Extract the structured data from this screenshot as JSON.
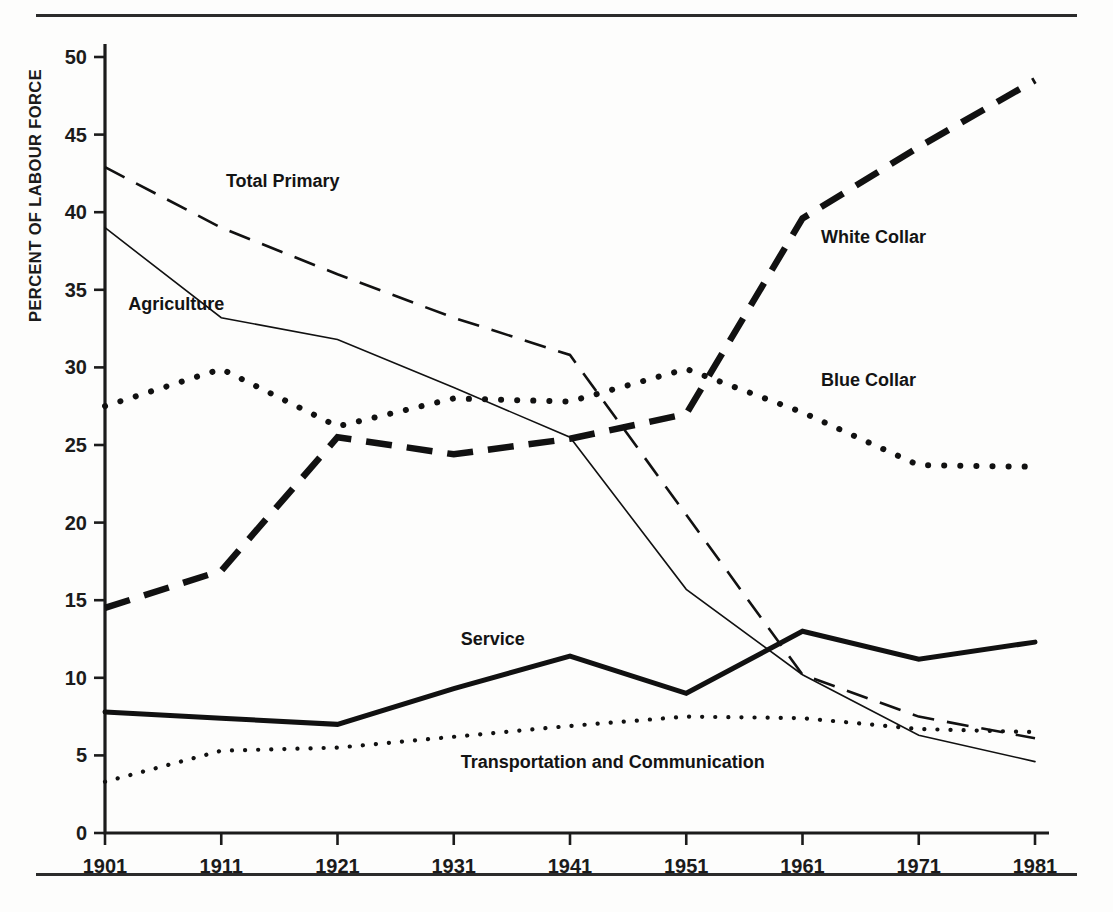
{
  "figure": {
    "y_axis_title": "PERCENT OF LABOUR FORCE"
  },
  "chart_data": {
    "type": "line",
    "title": "",
    "subtitle": "",
    "xlabel": "",
    "ylabel": "PERCENT OF LABOUR FORCE",
    "x": [
      1901,
      1911,
      1921,
      1931,
      1941,
      1951,
      1961,
      1971,
      1981
    ],
    "categories": [
      "1901",
      "1911",
      "1921",
      "1931",
      "1941",
      "1951",
      "1961",
      "1971",
      "1981"
    ],
    "xlim": [
      1901,
      1981
    ],
    "ylim": [
      0,
      50
    ],
    "yticks": [
      0,
      5,
      10,
      15,
      20,
      25,
      30,
      35,
      40,
      45,
      50
    ],
    "ytick_labels": [
      "0",
      "5",
      "10",
      "15",
      "20",
      "25",
      "30",
      "35",
      "40",
      "45",
      "50"
    ],
    "xticks": [
      1901,
      1911,
      1921,
      1931,
      1941,
      1951,
      1961,
      1971,
      1981
    ],
    "xtick_labels": [
      "1901",
      "1911",
      "1921",
      "1931",
      "1941",
      "1951",
      "1961",
      "1971",
      "1981"
    ],
    "grid": false,
    "legend_position": "inline-annotations",
    "series": [
      {
        "name": "Total Primary",
        "style": "dashed",
        "width": 2.6,
        "color": "#111111",
        "label_x": 1911.4,
        "label_y": 41.6,
        "values": [
          42.9,
          39.0,
          36.0,
          33.2,
          30.8,
          20.5,
          10.2,
          7.5,
          6.1
        ]
      },
      {
        "name": "Agriculture",
        "style": "solid-thin",
        "width": 1.6,
        "color": "#111111",
        "label_x": 1903.0,
        "label_y": 33.7,
        "values": [
          39.0,
          33.2,
          31.8,
          28.7,
          25.5,
          15.7,
          10.2,
          6.3,
          4.6
        ]
      },
      {
        "name": "White Collar",
        "style": "dashed-thick",
        "width": 6.5,
        "color": "#111111",
        "label_x": 1962.6,
        "label_y": 38.0,
        "values": [
          14.5,
          16.9,
          25.5,
          24.4,
          25.4,
          27.0,
          39.6,
          44.2,
          48.5
        ]
      },
      {
        "name": "Blue Collar",
        "style": "dotted-thick",
        "width": 6.0,
        "color": "#111111",
        "label_x": 1962.6,
        "label_y": 28.8,
        "values": [
          27.5,
          29.9,
          26.2,
          28.0,
          27.8,
          29.9,
          27.1,
          23.7,
          23.6
        ]
      },
      {
        "name": "Service",
        "style": "solid-thick",
        "width": 5.0,
        "color": "#111111",
        "label_x": 1931.6,
        "label_y": 12.1,
        "values": [
          7.8,
          7.4,
          7.0,
          9.3,
          11.4,
          9.0,
          13.0,
          11.2,
          12.3
        ]
      },
      {
        "name": "Transportation and Communication",
        "style": "dotted-thin",
        "width": 4.2,
        "color": "#111111",
        "label_x": 1931.6,
        "label_y": 4.2,
        "values": [
          3.3,
          5.3,
          5.5,
          6.2,
          6.9,
          7.5,
          7.4,
          6.7,
          6.5
        ]
      }
    ]
  }
}
